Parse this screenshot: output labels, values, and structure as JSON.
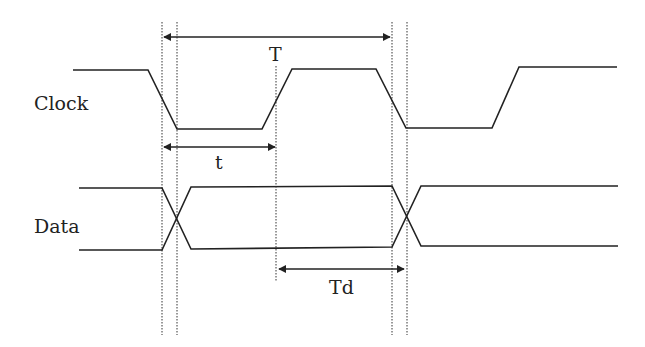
{
  "diagram": {
    "colors": {
      "line": "#222222",
      "background": "#ffffff"
    },
    "signals": [
      {
        "name": "Clock",
        "label": "Clock"
      },
      {
        "name": "Data",
        "label": "Data"
      }
    ],
    "intervals": [
      {
        "name": "period",
        "label": "T"
      },
      {
        "name": "pulse-width",
        "label": "t"
      },
      {
        "name": "delay",
        "label": "Td"
      }
    ]
  }
}
